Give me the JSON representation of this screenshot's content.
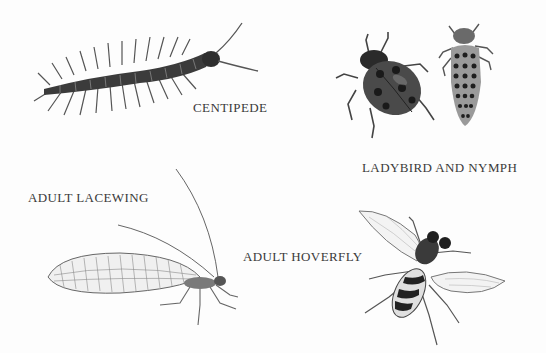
{
  "plate": {
    "background": "#fdfdfd",
    "ink_color": "#2e2e2e",
    "specimens": [
      {
        "id": "centipede",
        "label": "CENTIPEDE"
      },
      {
        "id": "ladybird",
        "label": "LADYBIRD AND NYMPH"
      },
      {
        "id": "lacewing",
        "label": "ADULT LACEWING"
      },
      {
        "id": "hoverfly",
        "label": "ADULT HOVERFLY"
      }
    ]
  }
}
